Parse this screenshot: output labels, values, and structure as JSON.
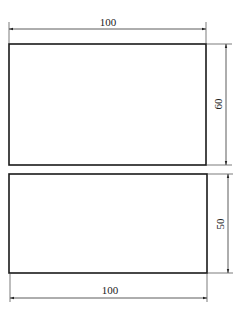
{
  "diagram": {
    "type": "dimensioned-rectangles",
    "colors": {
      "outline": "#1a1a1a",
      "dimension": "#333333",
      "background": "#ffffff"
    },
    "rectangles": [
      {
        "name": "top-rectangle",
        "width_label": "100",
        "height_label": "60"
      },
      {
        "name": "bottom-rectangle",
        "width_label": "100",
        "height_label": "50"
      }
    ]
  }
}
